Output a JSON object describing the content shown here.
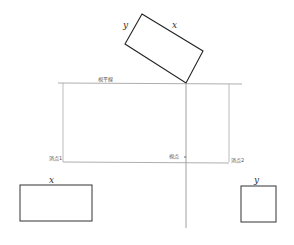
{
  "diagram": {
    "type": "two-point perspective construction",
    "labels": {
      "horizon_line": "視平線",
      "vanishing_point_1": "消点1",
      "viewpoint": "視点",
      "vanishing_point_2": "消点2"
    },
    "plan_rectangle": {
      "side_a": "y",
      "side_b": "x"
    },
    "elevation_x": {
      "label": "x"
    },
    "elevation_y": {
      "label": "y"
    }
  }
}
